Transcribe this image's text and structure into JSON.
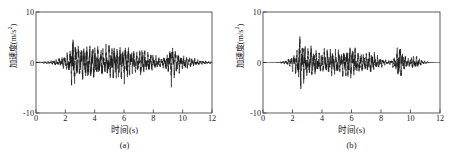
{
  "figure": {
    "panel_count": 2,
    "background_color": "#ffffff",
    "line_color": "#1a1a1a",
    "axis_color": "#4a4a4a"
  },
  "panels": [
    {
      "id": "a",
      "caption": "(a)",
      "xlabel": "时间(s)",
      "ylabel_text": "加速度(m/s",
      "ylabel_exp": "2",
      "ylabel_tail": ")",
      "xticks": [
        "0",
        "2",
        "4",
        "6",
        "8",
        "10",
        "12"
      ],
      "yticks": [
        "10",
        "0",
        "-10"
      ]
    },
    {
      "id": "b",
      "caption": "(b)",
      "xlabel": "时间(s)",
      "ylabel_text": "加速度(m/s",
      "ylabel_exp": "2",
      "ylabel_tail": ")",
      "xticks": [
        "0",
        "2",
        "4",
        "6",
        "8",
        "10",
        "12"
      ],
      "yticks": [
        "10",
        "0",
        "-10"
      ]
    }
  ],
  "chart_data": [
    {
      "type": "line",
      "id": "a",
      "title": "",
      "subtitle": "(a)",
      "xlabel": "时间(s)",
      "ylabel": "加速度(m/s^2)",
      "xlim": [
        0,
        12
      ],
      "ylim": [
        -10,
        10
      ],
      "xticks": [
        0,
        2,
        4,
        6,
        8,
        10,
        12
      ],
      "yticks": [
        -10,
        0,
        10
      ],
      "grid": false,
      "legend": null,
      "series_name": "acceleration record a",
      "description": "Earthquake ground-motion acceleration time history. Quiet pre-event noise from 0-1.5 s, first strong burst peaking near t=2.5 s (about +6.3 and -6.5 m/s^2), sustained strong shaking from 2.5 to 8 s with amplitudes roughly +/-3 to +/-4 m/s^2, a secondary burst near t=9.2 s reaching about +4.5 and -3.5 m/s^2, then decaying coda out to 12 s.",
      "envelope_x": [
        0.0,
        0.5,
        1.0,
        1.5,
        1.8,
        2.1,
        2.4,
        2.5,
        2.7,
        3.0,
        3.3,
        3.6,
        3.9,
        4.2,
        4.5,
        4.8,
        5.1,
        5.4,
        5.7,
        6.0,
        6.3,
        6.6,
        6.9,
        7.2,
        7.5,
        7.8,
        8.1,
        8.4,
        8.7,
        9.0,
        9.2,
        9.5,
        9.8,
        10.1,
        10.5,
        11.0,
        11.5,
        12.0
      ],
      "envelope_y": [
        0.12,
        0.2,
        0.35,
        0.7,
        1.1,
        1.8,
        3.6,
        6.4,
        4.2,
        3.6,
        3.9,
        3.4,
        3.2,
        3.5,
        3.0,
        3.3,
        3.6,
        3.3,
        3.8,
        3.9,
        3.2,
        2.6,
        2.4,
        2.8,
        2.2,
        1.8,
        1.3,
        1.0,
        1.2,
        2.2,
        4.6,
        2.6,
        1.8,
        1.5,
        1.0,
        0.6,
        0.35,
        0.2
      ],
      "peak_positive": 6.3,
      "peak_negative": -6.5,
      "peak_time": 2.5
    },
    {
      "type": "line",
      "id": "b",
      "title": "",
      "subtitle": "(b)",
      "xlabel": "时间(s)",
      "ylabel": "加速度(m/s^2)",
      "xlim": [
        0,
        12
      ],
      "ylim": [
        -10,
        10
      ],
      "xticks": [
        0,
        2,
        4,
        6,
        8,
        10,
        12
      ],
      "yticks": [
        -10,
        0,
        10
      ],
      "grid": false,
      "legend": null,
      "series_name": "acceleration record b",
      "description": "Earthquake ground-motion acceleration time history, slightly lower amplitude than (a). Flat until about 1.6 s, first strong burst at t=2.5 s (about +6.1 and -5.4 m/s^2), moderate shaking 2.5-8 s at roughly +/-2.5 to +/-3.5 m/s^2, short burst near t=9.2 s reaching about +4.3 and -3.8 m/s^2, small packet near 10.3 s, then essentially zero after 10.8 s.",
      "envelope_x": [
        0.0,
        0.5,
        1.0,
        1.5,
        1.7,
        2.0,
        2.3,
        2.5,
        2.7,
        3.0,
        3.3,
        3.6,
        3.9,
        4.2,
        4.5,
        4.8,
        5.1,
        5.4,
        5.7,
        6.0,
        6.3,
        6.6,
        6.9,
        7.2,
        7.5,
        7.8,
        8.1,
        8.4,
        8.7,
        9.0,
        9.2,
        9.5,
        9.8,
        10.1,
        10.4,
        10.8,
        11.3,
        12.0
      ],
      "envelope_y": [
        0.05,
        0.07,
        0.1,
        0.35,
        0.8,
        1.5,
        2.8,
        6.1,
        4.0,
        3.0,
        3.4,
        2.6,
        2.2,
        2.8,
        2.6,
        3.0,
        2.8,
        2.4,
        3.3,
        3.4,
        2.6,
        1.9,
        1.6,
        2.4,
        2.0,
        1.3,
        0.8,
        0.45,
        0.5,
        1.6,
        4.3,
        1.8,
        0.9,
        1.4,
        1.3,
        0.4,
        0.12,
        0.05
      ],
      "peak_positive": 6.1,
      "peak_negative": -5.4,
      "peak_time": 2.5
    }
  ]
}
